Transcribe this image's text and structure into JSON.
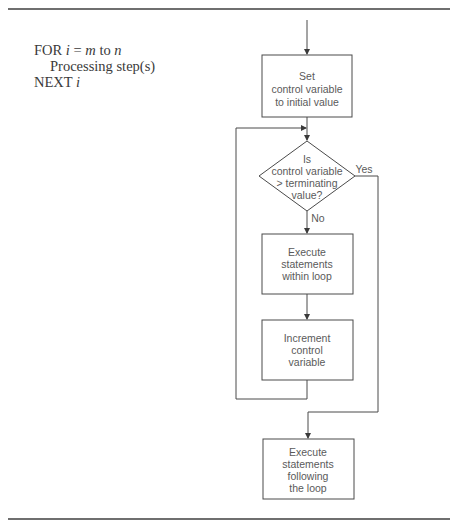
{
  "pseudocode": {
    "line1": {
      "keyword": "FOR ",
      "var": "i",
      "eq": " = ",
      "start": "m",
      "to": " to ",
      "end": "n"
    },
    "line2": "Processing step(s)",
    "line3": {
      "keyword": "NEXT ",
      "var": "i"
    }
  },
  "flowchart": {
    "init_box": [
      "Set",
      "control variable",
      "to initial value"
    ],
    "decision": [
      "Is",
      "control variable",
      "> terminating",
      "value?"
    ],
    "yes_label": "Yes",
    "no_label": "No",
    "body_box": [
      "Execute",
      "statements",
      "within loop"
    ],
    "increment_box": [
      "Increment",
      "control",
      "variable"
    ],
    "exit_box": [
      "Execute",
      "statements",
      "following",
      "the loop"
    ]
  },
  "colors": {
    "line": "#4a4a4a",
    "rule": "#6f6f6f",
    "text": "#5a5a5a"
  }
}
